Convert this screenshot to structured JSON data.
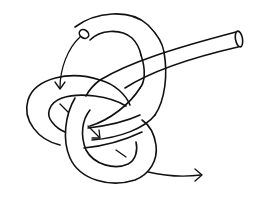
{
  "figure": {
    "title": "Knot tying diagram",
    "colors": {
      "background": "#ffffff",
      "line": "#111111"
    },
    "elements": {
      "rope_start_end": "open tube end (top left)",
      "rope_standing_end": "open tube end (top right)",
      "arrows": [
        {
          "name": "entry-arrow",
          "direction": "down into left loop"
        },
        {
          "name": "middle-arrow",
          "direction": "through center"
        },
        {
          "name": "exit-arrow",
          "direction": "out to the right"
        }
      ]
    }
  }
}
